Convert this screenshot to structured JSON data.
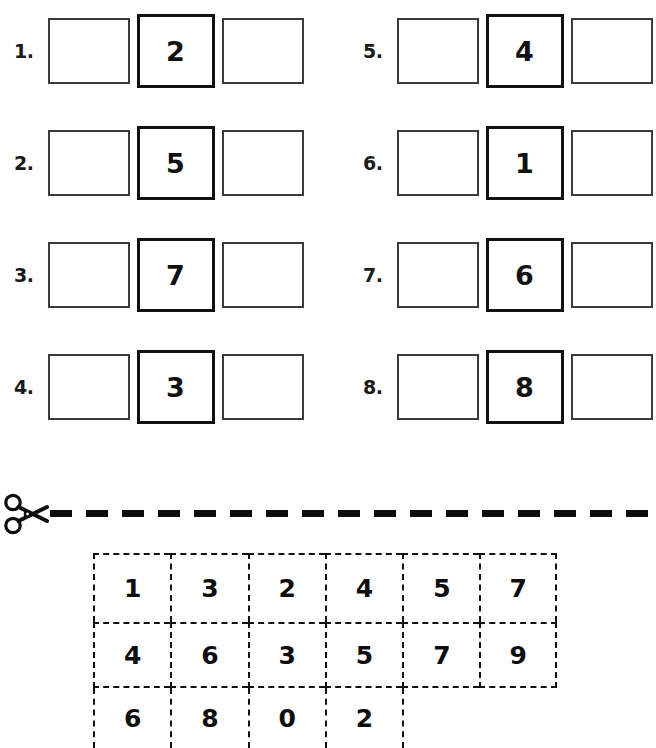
{
  "worksheet": {
    "problems_left": [
      {
        "number": "1.",
        "before": "",
        "given": "2",
        "after": ""
      },
      {
        "number": "2.",
        "before": "",
        "given": "5",
        "after": ""
      },
      {
        "number": "3.",
        "before": "",
        "given": "7",
        "after": ""
      },
      {
        "number": "4.",
        "before": "",
        "given": "3",
        "after": ""
      }
    ],
    "problems_right": [
      {
        "number": "5.",
        "before": "",
        "given": "4",
        "after": ""
      },
      {
        "number": "6.",
        "before": "",
        "given": "1",
        "after": ""
      },
      {
        "number": "7.",
        "before": "",
        "given": "6",
        "after": ""
      },
      {
        "number": "8.",
        "before": "",
        "given": "8",
        "after": ""
      }
    ],
    "cut_line": {
      "icon": "scissors-icon"
    },
    "cutout_grid": {
      "rows": [
        [
          "1",
          "3",
          "2",
          "4",
          "5",
          "7"
        ],
        [
          "4",
          "6",
          "3",
          "5",
          "7",
          "9"
        ],
        [
          "6",
          "8",
          "0",
          "2"
        ]
      ]
    }
  },
  "colors": {
    "ink": "#111111",
    "box_border": "#3a3a3a",
    "dash": "#0d0d0d"
  }
}
